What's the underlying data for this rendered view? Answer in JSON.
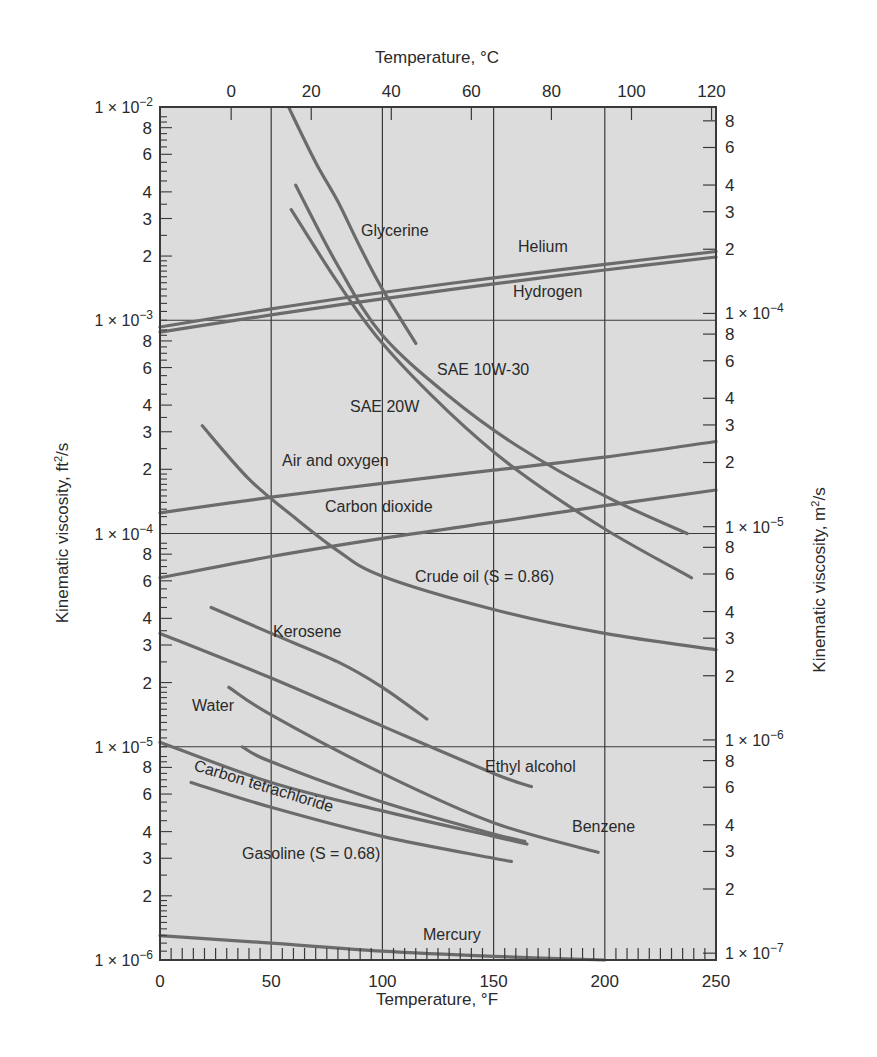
{
  "chart_data": {
    "type": "line",
    "title": "",
    "xlabel": "Temperature, °F",
    "x2label": "Temperature, °C",
    "ylabel": "Kinematic viscosity, ft²/s",
    "ylabel_unit_base": "Kinematic viscosity, ft",
    "ylabel_unit_sup": "2",
    "ylabel_unit_tail": "/s",
    "y2label_base": "Kinematic viscosity, m",
    "y2label_sup": "2",
    "y2label_tail": "/s",
    "y2label": "Kinematic viscosity, m²/s",
    "xlim": [
      0,
      250
    ],
    "ylim": [
      1e-06,
      0.01
    ],
    "yscale": "log",
    "grid": true,
    "x_ticks": [
      0,
      50,
      100,
      150,
      200,
      250
    ],
    "x2_ticks_celsius": [
      0,
      20,
      40,
      60,
      80,
      100,
      120
    ],
    "y_left_decades": [
      {
        "mant": "1 × 10",
        "exp": "−2",
        "value": 0.01
      },
      {
        "mant": "1 × 10",
        "exp": "−3",
        "value": 0.001
      },
      {
        "mant": "1 × 10",
        "exp": "−4",
        "value": 0.0001
      },
      {
        "mant": "1 × 10",
        "exp": "−5",
        "value": 1e-05
      },
      {
        "mant": "1 × 10",
        "exp": "−6",
        "value": 1e-06
      }
    ],
    "y_right_decades": [
      {
        "mant": "1 × 10",
        "exp": "−4",
        "value": 0.0001
      },
      {
        "mant": "1 × 10",
        "exp": "−5",
        "value": 1e-05
      },
      {
        "mant": "1 × 10",
        "exp": "−6",
        "value": 1e-06
      },
      {
        "mant": "1 × 10",
        "exp": "−7",
        "value": 1e-07
      }
    ],
    "y_minor_labels": [
      "8",
      "6",
      "4",
      "3",
      "2"
    ],
    "series": [
      {
        "name": "Helium",
        "x": [
          0,
          50,
          100,
          150,
          200,
          250
        ],
        "values": [
          0.00093,
          0.00113,
          0.00135,
          0.00158,
          0.00183,
          0.0021
        ]
      },
      {
        "name": "Hydrogen",
        "x": [
          0,
          50,
          100,
          150,
          200,
          250
        ],
        "values": [
          0.00088,
          0.00106,
          0.00126,
          0.00148,
          0.00172,
          0.00198
        ]
      },
      {
        "name": "Glycerine",
        "x": [
          58,
          70,
          80,
          90,
          100,
          115
        ],
        "values": [
          0.0099,
          0.0055,
          0.0036,
          0.0022,
          0.0014,
          0.00078
        ]
      },
      {
        "name": "SAE 10W-30",
        "x": [
          61,
          80,
          100,
          130,
          160,
          200,
          237
        ],
        "values": [
          0.0043,
          0.0018,
          0.00085,
          0.00044,
          0.00026,
          0.00015,
          0.0001
        ]
      },
      {
        "name": "SAE 20W",
        "x": [
          59,
          80,
          100,
          130,
          160,
          200,
          239
        ],
        "values": [
          0.0033,
          0.0015,
          0.00078,
          0.00037,
          0.0002,
          0.000105,
          6.2e-05
        ]
      },
      {
        "name": "Air and oxygen",
        "x": [
          0,
          50,
          100,
          150,
          200,
          250
        ],
        "values": [
          0.000125,
          0.000148,
          0.000172,
          0.000198,
          0.000228,
          0.00027
        ]
      },
      {
        "name": "Carbon dioxide",
        "x": [
          0,
          50,
          100,
          150,
          200,
          250
        ],
        "values": [
          6.2e-05,
          7.8e-05,
          9.5e-05,
          0.000113,
          0.000135,
          0.00016
        ]
      },
      {
        "name": "Crude oil (S = 0.86)",
        "x": [
          19,
          40,
          60,
          80,
          100,
          150,
          200,
          250
        ],
        "values": [
          0.00032,
          0.00018,
          0.00012,
          8.3e-05,
          6.3e-05,
          4.4e-05,
          3.4e-05,
          2.85e-05
        ]
      },
      {
        "name": "Kerosene",
        "x": [
          23,
          50,
          80,
          100,
          120
        ],
        "values": [
          4.5e-05,
          3.4e-05,
          2.5e-05,
          1.9e-05,
          1.35e-05
        ]
      },
      {
        "name": "Ethyl alcohol",
        "x": [
          0,
          50,
          100,
          150,
          167
        ],
        "values": [
          3.4e-05,
          2.1e-05,
          1.25e-05,
          7.5e-06,
          6.5e-06
        ]
      },
      {
        "name": "Water",
        "x": [
          31,
          50,
          100,
          150,
          197
        ],
        "values": [
          1.9e-05,
          1.41e-05,
          7.5e-06,
          4.4e-06,
          3.2e-06
        ]
      },
      {
        "name": "Benzene",
        "x": [
          37,
          50,
          100,
          150,
          164
        ],
        "values": [
          1e-05,
          8.5e-06,
          5.5e-06,
          3.9e-06,
          3.6e-06
        ]
      },
      {
        "name": "Carbon tetrachloride",
        "x": [
          0,
          50,
          100,
          150,
          165
        ],
        "values": [
          1.05e-05,
          6.8e-06,
          5e-06,
          3.8e-06,
          3.5e-06
        ]
      },
      {
        "name": "Gasoline (S = 0.68)",
        "x": [
          14,
          50,
          100,
          150,
          158
        ],
        "values": [
          6.8e-06,
          5.2e-06,
          3.8e-06,
          3e-06,
          2.9e-06
        ]
      },
      {
        "name": "Mercury",
        "x": [
          0,
          50,
          100,
          150,
          200
        ],
        "values": [
          1.3e-06,
          1.2e-06,
          1.1e-06,
          1.04e-06,
          1e-06
        ]
      }
    ],
    "annotations": [
      {
        "text": "Glycerine",
        "x_px": 361,
        "y_px": 236
      },
      {
        "text": "Helium",
        "x_px": 518,
        "y_px": 252
      },
      {
        "text": "Hydrogen",
        "x_px": 513,
        "y_px": 297
      },
      {
        "text": "SAE 10W-30",
        "x_px": 437,
        "y_px": 375
      },
      {
        "text": "SAE 20W",
        "x_px": 350,
        "y_px": 412
      },
      {
        "text": "Air and oxygen",
        "x_px": 282,
        "y_px": 466
      },
      {
        "text": "Carbon dioxide",
        "x_px": 325,
        "y_px": 512
      },
      {
        "text": "Crude oil (S = 0.86)",
        "x_px": 415,
        "y_px": 582
      },
      {
        "text": "Kerosene",
        "x_px": 273,
        "y_px": 637
      },
      {
        "text": "Water",
        "x_px": 192,
        "y_px": 711
      },
      {
        "text": "Ethyl alcohol",
        "x_px": 485,
        "y_px": 772
      },
      {
        "text": "Carbon tetrachloride",
        "x_px": 193,
        "y_px": 770,
        "rotate": 17
      },
      {
        "text": "Benzene",
        "x_px": 572,
        "y_px": 832
      },
      {
        "text": "Gasoline (S = 0.68)",
        "x_px": 242,
        "y_px": 859
      },
      {
        "text": "Mercury",
        "x_px": 423,
        "y_px": 940
      }
    ],
    "colors": {
      "plot_background": "#dcdcdc",
      "curve": "#6b6b6b",
      "grid": "#3a3a3a",
      "axis": "#3a3a3a",
      "text": "#2a2a2a"
    }
  }
}
